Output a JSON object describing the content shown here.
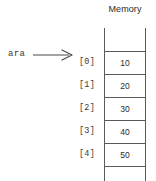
{
  "diagram": {
    "memory_header": "Memory",
    "variable": {
      "name": "ara",
      "pointer_icon": "right-arrow-icon"
    },
    "top_empty_cell": {
      "index": "",
      "value": ""
    },
    "bottom_empty_cell": {
      "index": "",
      "value": ""
    },
    "cells": [
      {
        "index": "[0]",
        "value": "10"
      },
      {
        "index": "[1]",
        "value": "20"
      },
      {
        "index": "[2]",
        "value": "30"
      },
      {
        "index": "[3]",
        "value": "40"
      },
      {
        "index": "[4]",
        "value": "50"
      }
    ],
    "colors": {
      "background": "#ffffff",
      "line": "#5a5a5a",
      "text": "#2b2b2b",
      "mono_text": "#3a3a3a"
    }
  }
}
